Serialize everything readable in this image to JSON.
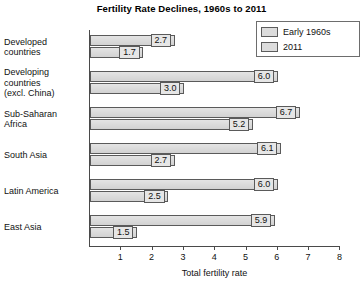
{
  "chart_data": {
    "type": "bar",
    "orientation": "horizontal",
    "title": "Fertility Rate Declines, 1960s to 2011",
    "xlabel": "Total fertility rate",
    "ylabel": "",
    "xlim": [
      0,
      8.5
    ],
    "xticks": [
      1,
      2,
      3,
      4,
      5,
      6,
      7,
      8
    ],
    "grid": false,
    "legend_position": "top-right",
    "categories": [
      "Developed countries",
      "Developing countries (excl. China)",
      "Sub-Saharan Africa",
      "South Asia",
      "Latin America",
      "East Asia"
    ],
    "category_lines": [
      [
        "Developed",
        "countries"
      ],
      [
        "Developing",
        "countries",
        "(excl. China)"
      ],
      [
        "Sub-Saharan",
        "Africa"
      ],
      [
        "South Asia"
      ],
      [
        "Latin America"
      ],
      [
        "East Asia"
      ]
    ],
    "series": [
      {
        "name": "Early 1960s",
        "values": [
          2.7,
          6.0,
          6.7,
          6.1,
          6.0,
          5.9
        ],
        "labels": [
          "2.7",
          "6.0",
          "6.7",
          "6.1",
          "6.0",
          "5.9"
        ]
      },
      {
        "name": "2011",
        "values": [
          1.7,
          3.0,
          5.2,
          2.7,
          2.5,
          1.5
        ],
        "labels": [
          "1.7",
          "3.0",
          "5.2",
          "2.7",
          "2.5",
          "1.5"
        ]
      }
    ],
    "colors": {
      "bar_fill": "#dcdcdc",
      "bar_border": "#5a5a5a",
      "axis": "#4a4a4a",
      "text": "#111111",
      "background": "#ffffff"
    }
  },
  "legend": {
    "items": [
      {
        "label": "Early 1960s"
      },
      {
        "label": "2011"
      }
    ]
  },
  "xaxis": {
    "title": "Total fertility rate",
    "ticks": [
      "1",
      "2",
      "3",
      "4",
      "5",
      "6",
      "7",
      "8"
    ]
  }
}
